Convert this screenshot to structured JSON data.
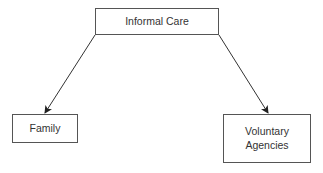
{
  "diagram": {
    "type": "hierarchy",
    "root": {
      "label": "Informal Care"
    },
    "children": [
      {
        "label": "Family"
      },
      {
        "label_line1": "Voluntary",
        "label_line2": "Agencies"
      }
    ],
    "edges": [
      {
        "from": "Informal Care",
        "to": "Family"
      },
      {
        "from": "Informal Care",
        "to": "Voluntary Agencies"
      }
    ]
  }
}
